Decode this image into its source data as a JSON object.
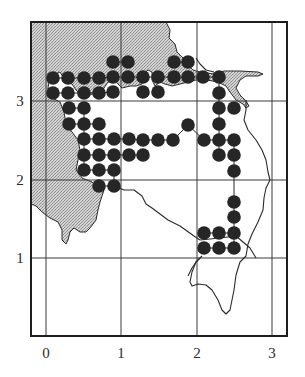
{
  "figure": {
    "type": "grid-map",
    "background": "#ffffff",
    "shade_color": "#bdbdbd",
    "dot_color": "#262626",
    "frame": {
      "x": 31,
      "y": 22,
      "width": 256,
      "height": 314
    },
    "x_axis": {
      "ticks": [
        {
          "label": "0",
          "px": 46
        },
        {
          "label": "1",
          "px": 121
        },
        {
          "label": "2",
          "px": 197
        },
        {
          "label": "3",
          "px": 272
        }
      ],
      "label_y": 358
    },
    "y_axis": {
      "ticks": [
        {
          "label": "3",
          "py": 101
        },
        {
          "label": "2",
          "py": 180
        },
        {
          "label": "1",
          "py": 258
        }
      ],
      "label_x": 20
    },
    "dot_radius": 6.8,
    "dots": [
      [
        113,
        62
      ],
      [
        128,
        62
      ],
      [
        174,
        62
      ],
      [
        188,
        62
      ],
      [
        53,
        78
      ],
      [
        68,
        78
      ],
      [
        84,
        78
      ],
      [
        99,
        78
      ],
      [
        113,
        77
      ],
      [
        128,
        77
      ],
      [
        143,
        77
      ],
      [
        158,
        77
      ],
      [
        174,
        77
      ],
      [
        188,
        77
      ],
      [
        203,
        77
      ],
      [
        219,
        77
      ],
      [
        53,
        93
      ],
      [
        68,
        93
      ],
      [
        84,
        93
      ],
      [
        99,
        93
      ],
      [
        113,
        92
      ],
      [
        143,
        92
      ],
      [
        158,
        92
      ],
      [
        219,
        93
      ],
      [
        69,
        108
      ],
      [
        84,
        108
      ],
      [
        219,
        108
      ],
      [
        234,
        108
      ],
      [
        69,
        124
      ],
      [
        84,
        124
      ],
      [
        99,
        124
      ],
      [
        188,
        125
      ],
      [
        219,
        124
      ],
      [
        84,
        139
      ],
      [
        99,
        139
      ],
      [
        114,
        139
      ],
      [
        129,
        139
      ],
      [
        143,
        140
      ],
      [
        158,
        140
      ],
      [
        173,
        140
      ],
      [
        204,
        140
      ],
      [
        219,
        140
      ],
      [
        234,
        140
      ],
      [
        84,
        155
      ],
      [
        99,
        155
      ],
      [
        114,
        155
      ],
      [
        129,
        155
      ],
      [
        143,
        155
      ],
      [
        219,
        155
      ],
      [
        234,
        155
      ],
      [
        84,
        170
      ],
      [
        99,
        170
      ],
      [
        114,
        170
      ],
      [
        234,
        171
      ],
      [
        99,
        186
      ],
      [
        114,
        186
      ],
      [
        234,
        202
      ],
      [
        234,
        217
      ],
      [
        204,
        233
      ],
      [
        219,
        233
      ],
      [
        234,
        233
      ],
      [
        204,
        248
      ],
      [
        219,
        248
      ],
      [
        234,
        248
      ]
    ],
    "shaded_land_path": "M31,22 L166,22 L170,30 L169,38 L175,44 L177,52 L183,58 L187,64 L193,70 L200,72 L214,74 L224,71 L240,71 L258,72 L263,74 L258,76 L246,76 L240,80 L236,88 L240,95 L246,101 L249,106 L246,108 L243,104 L236,100 L230,92 L226,86 L218,82 L207,80 L196,80 L188,82 L180,84 L172,86 L165,84 L160,82 L155,86 L152,80 L152,72 L148,70 L144,74 L142,84 L136,86 L130,86 L122,88 L116,82 L108,82 L104,88 L96,92 L88,96 L80,94 L76,90 L72,84 L66,82 L60,72 L56,74 L50,76 L48,88 L52,98 L60,102 L64,112 L66,124 L72,132 L78,140 L80,150 L78,160 L76,170 L82,178 L92,182 L98,188 L104,190 L102,196 L100,202 L98,210 L96,220 L90,228 L86,232 L80,232 L74,228 L70,232 L68,240 L66,244 L62,240 L62,230 L58,222 L50,218 L42,212 L36,206 L31,204 Z",
    "coast_paths": [
      "M196,58 L200,64 L206,70 L214,72",
      "M246,100 L246,110 L244,120 L248,130 L256,140 L262,150 L266,160 L268,172 L270,180 L266,188 L264,198 L263,210 L258,222 L252,234 L248,244 L246,256 L240,262 L236,275 L234,290 L232,300 L230,310 L226,314 L222,310 L218,300 L212,290 L206,285 L198,284 L192,286 L190,282 L192,272 L196,262 L200,258",
      "M188,276 L192,268 L196,262 L202,256",
      "M114,186 L124,190 L134,190 L142,196 L146,204 L152,208 L160,214 L168,220 L180,226 L194,236 L200,240",
      "M200,240 L220,238 L236,236 L250,248 L256,258"
    ],
    "route_paths": [
      "M53,78 L68,78 L84,78 L99,78 L113,77 L128,77 L143,77 L158,77 L174,77 L188,77 L203,77 L219,77",
      "M53,93 L68,93 L84,93 L99,93 L113,92",
      "M113,62 L128,62",
      "M174,62 L188,62",
      "M219,77 L219,93 L219,108 L219,124 L219,140 L219,155",
      "M69,108 L84,108",
      "M69,124 L84,124 L99,124",
      "M84,139 L99,139 L114,139 L129,139 L143,140 L158,140 L173,140 L188,125 L204,140 L219,140 L234,140",
      "M84,155 L99,155 L114,155 L129,155 L143,155",
      "M234,140 L234,155 L234,171 L234,202 L234,217 L234,233 L234,248",
      "M204,233 L219,233 L234,233",
      "M204,248 L219,248 L234,248",
      "M84,170 L99,170 L114,170 L114,186 L99,186",
      "M84,108 L84,124 L84,139 L84,155 L84,170"
    ]
  }
}
